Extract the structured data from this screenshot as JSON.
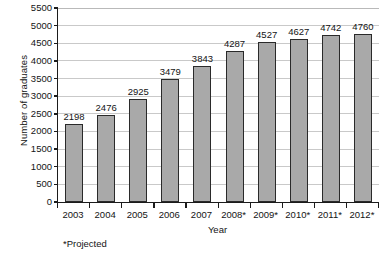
{
  "chart_data": {
    "type": "bar",
    "title": "",
    "xlabel": "Year",
    "ylabel": "Number of graduates",
    "categories": [
      "2003",
      "2004",
      "2005",
      "2006",
      "2007",
      "2008*",
      "2009*",
      "2010*",
      "2011*",
      "2012*"
    ],
    "values": [
      2198,
      2476,
      2925,
      3479,
      3843,
      4287,
      4527,
      4627,
      4742,
      4760
    ],
    "data_labels": [
      "2198",
      "2476",
      "2925",
      "3479",
      "3843",
      "4287",
      "4527",
      "4627",
      "4742",
      "4760"
    ],
    "ylim": [
      0,
      5500
    ],
    "ytick_step": 500,
    "ytick_labels": [
      "0",
      "500",
      "1000",
      "1500",
      "2000",
      "2500",
      "3000",
      "3500",
      "4000",
      "4500",
      "5000",
      "5500"
    ],
    "grid": "horizontal",
    "legend": "none",
    "bar_fill_color": "#a9a9a9",
    "bar_border_color": "#2a2a2a",
    "gridline_color": "#c9c9c9",
    "axis_color": "#1b1b1b",
    "background_color": "#ffffff",
    "annotations": [
      "*Projected"
    ]
  },
  "footnote": "*Projected"
}
